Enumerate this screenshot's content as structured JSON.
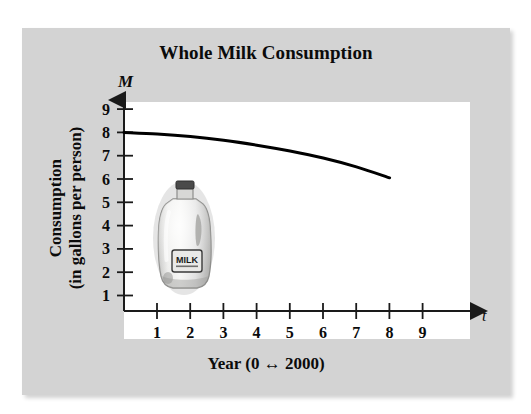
{
  "figure": {
    "title": "Whole Milk Consumption",
    "y_axis_symbol": "M",
    "x_axis_symbol": "t",
    "y_axis_title_line1": "Consumption",
    "y_axis_title_line2": "(in gallons per person)",
    "x_axis_title": "Year (0 ↔ 2000)",
    "illustration_label": "MILK",
    "panel_color": "#d3d3d3",
    "plot_color": "#ffffff",
    "curve_color": "#000000"
  },
  "chart_data": {
    "type": "line",
    "title": "Whole Milk Consumption",
    "xlabel": "Year (0 ↔ 2000)",
    "ylabel": "Consumption (in gallons per person)",
    "x_symbol": "t",
    "y_symbol": "M",
    "xlim": [
      0,
      9.6
    ],
    "ylim": [
      0,
      9.6
    ],
    "xticks": [
      1,
      2,
      3,
      4,
      5,
      6,
      7,
      8,
      9
    ],
    "yticks": [
      1,
      2,
      3,
      4,
      5,
      6,
      7,
      8,
      9
    ],
    "xtick_labels": [
      "1",
      "2",
      "3",
      "4",
      "5",
      "6",
      "7",
      "8",
      "9"
    ],
    "ytick_labels": [
      "1",
      "2",
      "3",
      "4",
      "5",
      "6",
      "7",
      "8",
      "9"
    ],
    "grid": false,
    "legend": false,
    "series": [
      {
        "name": "Whole milk consumption",
        "x": [
          0,
          1,
          2,
          3,
          4,
          5,
          6,
          7,
          8
        ],
        "values": [
          8.0,
          7.93,
          7.82,
          7.66,
          7.45,
          7.2,
          6.9,
          6.52,
          6.05
        ]
      }
    ]
  }
}
